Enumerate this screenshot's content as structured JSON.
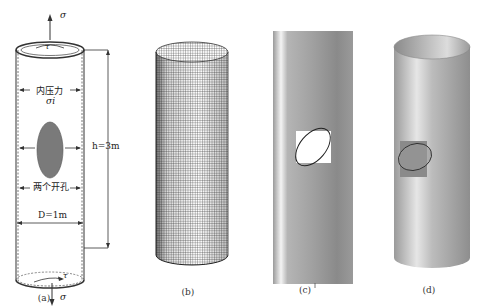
{
  "figure": {
    "panels": [
      {
        "id": "a",
        "caption": "(a)",
        "type": "schematic",
        "labels": {
          "sigma_top": "σ",
          "tau_top": "τ",
          "internal_pressure": "内压力",
          "sigma_i": "σi",
          "two_holes": "两个开孔",
          "height": "h=3m",
          "diameter": "D=1m",
          "tau_bottom": "τ",
          "sigma_bottom": "σ"
        }
      },
      {
        "id": "b",
        "caption": "(b)",
        "type": "mesh-cylinder"
      },
      {
        "id": "c",
        "caption": "(c)",
        "type": "unrolled-shell-with-hole"
      },
      {
        "id": "d",
        "caption": "(d)",
        "type": "shaded-cylinder-with-hole"
      }
    ]
  },
  "colors": {
    "hole_fill": "#7a7a7a",
    "line": "#333333",
    "mesh": "#444444",
    "shell_dark": "#8a8a8a",
    "shell_light": "#e8e8e8"
  }
}
